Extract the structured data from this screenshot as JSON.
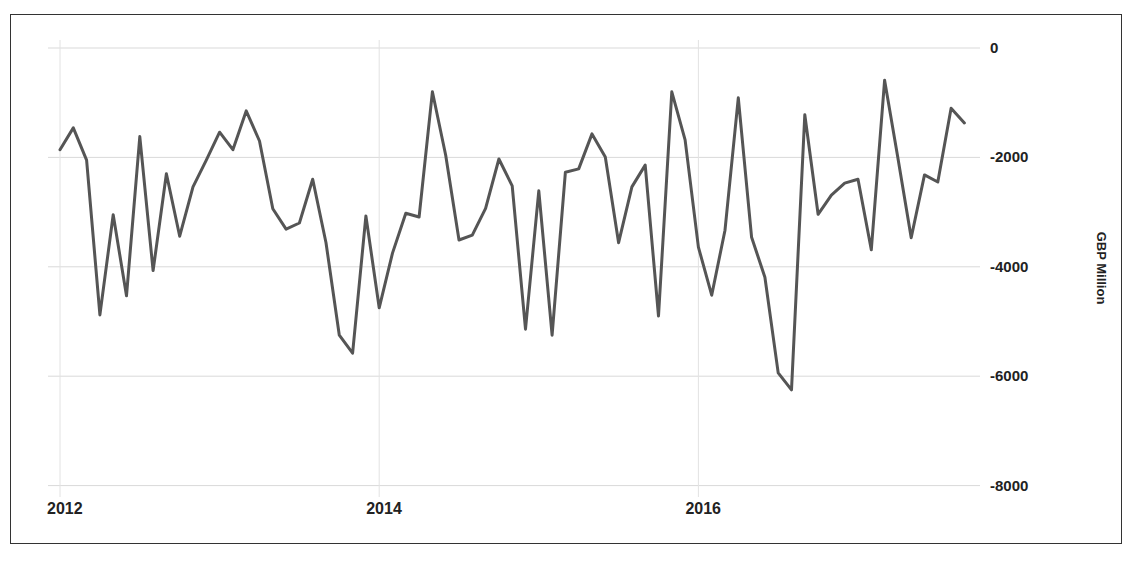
{
  "chart_data": {
    "type": "line",
    "title": "",
    "xlabel": "",
    "ylabel": "GBP Million",
    "ylim": [
      -8000,
      0
    ],
    "y_ticks": [
      0,
      -2000,
      -4000,
      -6000,
      -8000
    ],
    "y_tick_labels": [
      "0",
      "-2000",
      "-4000",
      "-6000",
      "-8000"
    ],
    "x_tick_labels": [
      "2012",
      "2014",
      "2016"
    ],
    "grid": true,
    "legend": "none",
    "y_axis_position": "right",
    "x_start": "2012-01",
    "frequency": "monthly",
    "series": [
      {
        "name": "GBP Million",
        "color": "#555555",
        "values": [
          -1860,
          -1460,
          -2050,
          -4880,
          -3050,
          -4530,
          -1620,
          -4070,
          -2300,
          -3440,
          -2540,
          -2050,
          -1540,
          -1860,
          -1150,
          -1700,
          -2940,
          -3310,
          -3200,
          -2400,
          -3560,
          -5250,
          -5580,
          -3070,
          -4750,
          -3750,
          -3020,
          -3090,
          -800,
          -1960,
          -3510,
          -3420,
          -2930,
          -2030,
          -2520,
          -5140,
          -2610,
          -5250,
          -2270,
          -2210,
          -1570,
          -1990,
          -3560,
          -2540,
          -2140,
          -4900,
          -800,
          -1680,
          -3640,
          -4520,
          -3330,
          -910,
          -3460,
          -4190,
          -5940,
          -6250,
          -1220,
          -3040,
          -2690,
          -2470,
          -2400,
          -3690,
          -590,
          -2010,
          -3470,
          -2320,
          -2450,
          -1100,
          -1370
        ]
      }
    ]
  },
  "axis": {
    "y_label": "GBP Million",
    "y_ticks": [
      "0",
      "-2000",
      "-4000",
      "-6000",
      "-8000"
    ],
    "x_ticks": [
      "2012",
      "2014",
      "2016"
    ]
  }
}
